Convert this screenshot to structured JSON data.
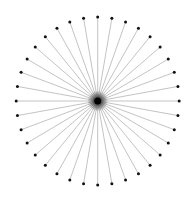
{
  "diagram": {
    "type": "radial-burst",
    "spoke_count": 36,
    "angle_step_deg": 10,
    "center": {
      "x": 97.7,
      "y": 101
    },
    "radius_x": 81.5,
    "radius_y": 84,
    "line_color": "#9a9a9a",
    "dot_color": "#111111",
    "center_color": "#000000",
    "dot_radius": 1.5,
    "center_radius": 3.5
  }
}
